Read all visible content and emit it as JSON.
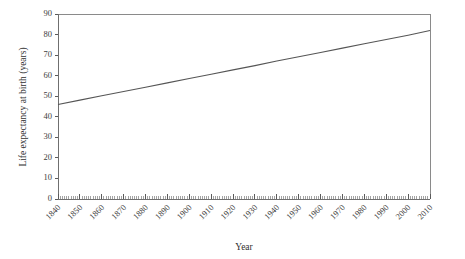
{
  "chart_data": {
    "type": "line",
    "title": "",
    "xlabel": "Year",
    "ylabel": "Life expectancy at birth (years)",
    "xlim": [
      1840,
      2010
    ],
    "ylim": [
      0,
      90
    ],
    "grid": false,
    "legend": "none",
    "x_tick_labels": [
      "1840",
      "1850",
      "1860",
      "1870",
      "1880",
      "1890",
      "1900",
      "1910",
      "1920",
      "1930",
      "1940",
      "1950",
      "1960",
      "1970",
      "1980",
      "1990",
      "2000",
      "2010"
    ],
    "x_ticks": [
      1840,
      1850,
      1860,
      1870,
      1880,
      1890,
      1900,
      1910,
      1920,
      1930,
      1940,
      1950,
      1960,
      1970,
      1980,
      1990,
      2000,
      2010
    ],
    "x_tick_rotation": 45,
    "x_minor_tick_step": 1,
    "y_tick_labels": [
      "0",
      "10",
      "20",
      "30",
      "40",
      "50",
      "60",
      "70",
      "80",
      "90"
    ],
    "y_ticks": [
      0,
      10,
      20,
      30,
      40,
      50,
      60,
      70,
      80,
      90
    ],
    "series": [
      {
        "name": "Life expectancy at birth",
        "color": "#555555",
        "x": [
          1840,
          1850,
          1860,
          1870,
          1880,
          1890,
          1900,
          1910,
          1920,
          1930,
          1940,
          1950,
          1960,
          1970,
          1980,
          1990,
          2000,
          2010
        ],
        "values": [
          46.0,
          48.1,
          50.2,
          52.3,
          54.4,
          56.5,
          58.6,
          60.7,
          62.8,
          64.9,
          67.1,
          69.2,
          71.3,
          73.4,
          75.5,
          77.6,
          79.7,
          82.0
        ]
      }
    ]
  },
  "figure": {
    "background_color": "#ffffff",
    "axis_color": "#6f6f6f",
    "line_color": "#555555",
    "text_color": "#3c3c3c"
  }
}
